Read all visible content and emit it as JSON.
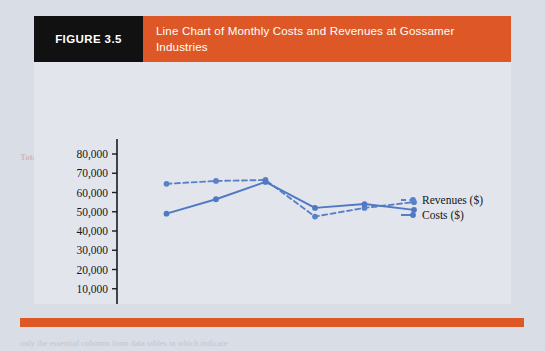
{
  "figure": {
    "tag": "FIGURE 3.5",
    "title": "Line Chart of Monthly Costs and Revenues at Gossamer Industries",
    "tag_bg": "#111112",
    "title_bg": "#dd5826"
  },
  "chart_data": {
    "type": "line",
    "title": "Line Chart of Monthly Costs and Revenues at Gossamer Industries",
    "xlabel": "Month",
    "ylabel": "",
    "x": [
      1,
      2,
      3,
      4,
      5,
      6
    ],
    "xlim": [
      0,
      6
    ],
    "ylim": [
      0,
      80000
    ],
    "xticks": [
      "0",
      "1",
      "2",
      "3",
      "4",
      "5",
      "6"
    ],
    "yticks": [
      "0",
      "10,000",
      "20,000",
      "30,000",
      "40,000",
      "50,000",
      "60,000",
      "70,000",
      "80,000"
    ],
    "grid": false,
    "legend_position": "right",
    "series": [
      {
        "name": "Revenues ($)",
        "style": "dashed",
        "color": "#5a80c8",
        "values": [
          64500,
          66000,
          66500,
          47500,
          52000,
          55000
        ]
      },
      {
        "name": "Costs ($)",
        "style": "solid",
        "color": "#4f79c4",
        "values": [
          49000,
          56500,
          65500,
          52000,
          54000,
          51000
        ]
      }
    ]
  },
  "bleed_text": {
    "top_row": [
      "D",
      "E",
      "F",
      "G",
      "H"
    ],
    "lines": [
      "Hard costs",
      "Contract",
      "Materials",
      "to cover the",
      "tting, it would be",
      "in Table 3.4)  represent",
      "Total Costs",
      "In charts we are referring to number and other data are",
      "the asterisk when we do not wish to indicate",
      "only the essential columns from data tables in which indicate"
    ]
  }
}
